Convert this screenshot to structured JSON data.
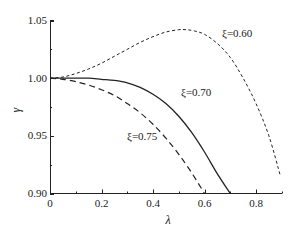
{
  "chart_data": {
    "type": "line",
    "title": "",
    "xlabel": "λ",
    "ylabel": "γ",
    "xlim": [
      0,
      0.9
    ],
    "ylim": [
      0.9,
      1.05
    ],
    "grid": false,
    "legend": "none (inline curve annotations)",
    "x_ticks": [
      "0",
      "0.2",
      "0.4",
      "0.6",
      "0.8"
    ],
    "x_tick_values": [
      0,
      0.2,
      0.4,
      0.6,
      0.8
    ],
    "x_minor_ticks": [
      0.1,
      0.3,
      0.5,
      0.7,
      0.9
    ],
    "y_ticks": [
      "0.90",
      "0.95",
      "1.00",
      "1.05"
    ],
    "y_tick_values": [
      0.9,
      0.95,
      1.0,
      1.05
    ],
    "y_minor_ticks": [
      0.925,
      0.975,
      1.025
    ],
    "series": [
      {
        "name": "ξ=0.60",
        "style": "dotted",
        "x": [
          0,
          0.05,
          0.1,
          0.15,
          0.2,
          0.25,
          0.3,
          0.35,
          0.4,
          0.45,
          0.5,
          0.53,
          0.56,
          0.6,
          0.65,
          0.7,
          0.75,
          0.8,
          0.85,
          0.895
        ],
        "y": [
          1.0,
          1.001,
          1.004,
          1.008,
          1.013,
          1.019,
          1.025,
          1.031,
          1.036,
          1.04,
          1.042,
          1.042,
          1.041,
          1.038,
          1.03,
          1.018,
          1.0,
          0.978,
          0.95,
          0.915
        ]
      },
      {
        "name": "ξ=0.70",
        "style": "solid",
        "x": [
          0,
          0.05,
          0.1,
          0.15,
          0.2,
          0.25,
          0.3,
          0.35,
          0.4,
          0.45,
          0.5,
          0.55,
          0.6,
          0.65,
          0.7
        ],
        "y": [
          1.0,
          1.0,
          1.0,
          1.0,
          0.999,
          0.998,
          0.996,
          0.992,
          0.986,
          0.978,
          0.967,
          0.953,
          0.936,
          0.917,
          0.9
        ]
      },
      {
        "name": "ξ=0.75",
        "style": "dashed",
        "x": [
          0,
          0.05,
          0.1,
          0.15,
          0.2,
          0.25,
          0.3,
          0.35,
          0.4,
          0.45,
          0.5,
          0.55,
          0.6
        ],
        "y": [
          1.0,
          0.999,
          0.997,
          0.994,
          0.99,
          0.985,
          0.978,
          0.97,
          0.96,
          0.948,
          0.934,
          0.918,
          0.9
        ]
      }
    ],
    "annotations": [
      {
        "text": "ξ=0.60",
        "x": 0.7,
        "y": 1.04
      },
      {
        "text": "ξ=0.70",
        "x": 0.57,
        "y": 0.993
      },
      {
        "text": "ξ=0.75",
        "x": 0.28,
        "y": 0.953
      }
    ]
  },
  "labels": {
    "xlabel": "λ",
    "ylabel": "γ",
    "ann_060": "ξ=0.60",
    "ann_070": "ξ=0.70",
    "ann_075": "ξ=0.75",
    "x0": "0",
    "x1": "0.2",
    "x2": "0.4",
    "x3": "0.6",
    "x4": "0.8",
    "y0": "0.90",
    "y1": "0.95",
    "y2": "1.00",
    "y3": "1.05"
  }
}
